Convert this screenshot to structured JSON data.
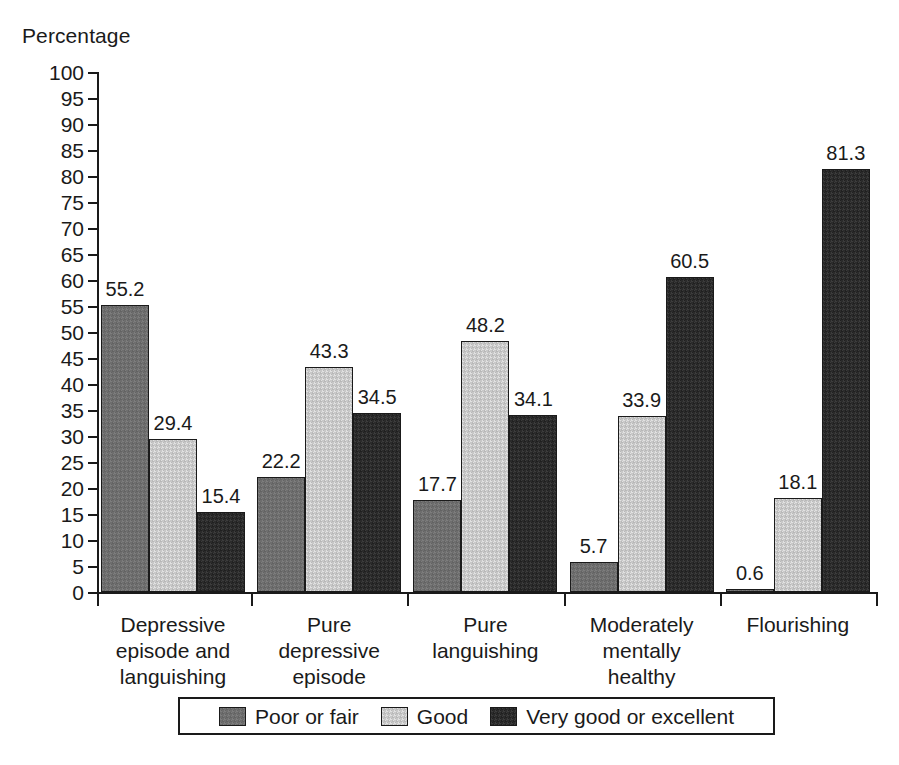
{
  "chart_data": {
    "type": "bar",
    "title": "",
    "xlabel": "",
    "ylabel": "Percentage",
    "ylim": [
      0,
      100
    ],
    "ytick_step": 5,
    "yticks": [
      0,
      5,
      10,
      15,
      20,
      25,
      30,
      35,
      40,
      45,
      50,
      55,
      60,
      65,
      70,
      75,
      80,
      85,
      90,
      95,
      100
    ],
    "grid": false,
    "legend_position": "bottom",
    "categories": [
      "Depressive\nepisode and\nlanguishing",
      "Pure\ndepressive\nepisode",
      "Pure\nlanguishing",
      "Moderately\nmentally\nhealthy",
      "Flourishing"
    ],
    "series": [
      {
        "name": "Poor or fair",
        "color": "#6e6e6e",
        "values": [
          55.2,
          22.2,
          17.7,
          5.7,
          0.6
        ],
        "labels": [
          "55.2",
          "22.2",
          "17.7",
          "5.7",
          "0.6"
        ]
      },
      {
        "name": "Good",
        "color": "#c8c8c8",
        "values": [
          29.4,
          43.3,
          48.2,
          33.9,
          18.1
        ],
        "labels": [
          "29.4",
          "43.3",
          "48.2",
          "33.9",
          "18.1"
        ]
      },
      {
        "name": "Very good or excellent",
        "color": "#2b2b2b",
        "values": [
          15.4,
          34.5,
          34.1,
          60.5,
          81.3
        ],
        "labels": [
          "15.4",
          "34.5",
          "34.1",
          "60.5",
          "81.3"
        ]
      }
    ]
  },
  "axis": {
    "y_title": "Percentage"
  },
  "colors": {
    "axis": "#1a1a1a",
    "background": "#ffffff",
    "poor_or_fair": "#6e6e6e",
    "good": "#c8c8c8",
    "very_good_or_excellent": "#2b2b2b"
  }
}
